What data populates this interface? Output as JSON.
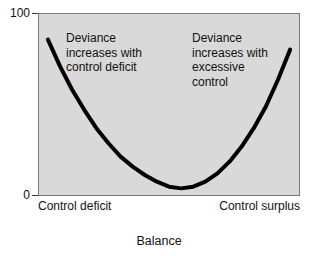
{
  "chart_data": {
    "type": "line",
    "title": "",
    "xlabel": "Balance",
    "ylabel": "",
    "ylim": [
      0,
      100
    ],
    "y_ticks": [
      "0",
      "100"
    ],
    "x_tick_labels": [
      "Control deficit",
      "Control surplus"
    ],
    "grid": false,
    "legend": "none",
    "plot_background": "#d9d9d9",
    "line_color": "#000000",
    "line_width": 4,
    "series": [
      {
        "name": "Deviance",
        "description": "U-shaped (quadratic) relationship between control balance and deviance",
        "x": [
          0,
          5,
          10,
          15,
          20,
          25,
          30,
          35,
          40,
          45,
          50,
          55,
          60,
          65,
          70,
          75,
          80,
          85,
          90,
          95,
          100
        ],
        "y": [
          90,
          74,
          60,
          48,
          37,
          28,
          20,
          14,
          9,
          5,
          2,
          1,
          2,
          5,
          10,
          17,
          26,
          37,
          50,
          66,
          84
        ]
      }
    ],
    "annotations": [
      {
        "name": "left-annotation",
        "lines": [
          "Deviance",
          "increases with",
          "control deficit"
        ],
        "position": "upper-left"
      },
      {
        "name": "right-annotation",
        "lines": [
          "Deviance",
          "increases with",
          "excessive",
          "control"
        ],
        "position": "upper-right"
      }
    ]
  },
  "axis": {
    "y_top_label": "100",
    "y_bottom_label": "0",
    "x_left_line1": "Control",
    "x_left_line2": "deficit",
    "x_right_line1": "Control",
    "x_right_line2": "surplus",
    "x_title": "Balance"
  },
  "annotations": {
    "left": {
      "line1": "Deviance",
      "line2": "increases with",
      "line3": "control deficit"
    },
    "right": {
      "line1": "Deviance",
      "line2": "increases with",
      "line3": "excessive",
      "line4": "control"
    }
  },
  "colors": {
    "plot_background": "#d9d9d9",
    "curve": "#000000",
    "text": "#111111",
    "frame": "#7a7a7a",
    "page_background": "#ffffff"
  }
}
